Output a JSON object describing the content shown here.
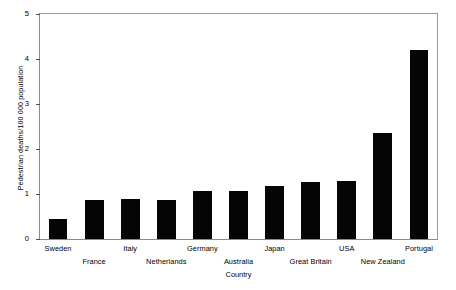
{
  "chart_data": {
    "type": "bar",
    "title": "",
    "xlabel": "Country",
    "ylabel": "Pedestrian deaths/100 000 population",
    "categories": [
      "Sweden",
      "France",
      "Italy",
      "Netherlands",
      "Germany",
      "Australia",
      "Japan",
      "Great Britain",
      "USA",
      "New Zealand",
      "Portugal"
    ],
    "values": [
      0.44,
      0.87,
      0.89,
      0.87,
      1.07,
      1.06,
      1.18,
      1.27,
      1.29,
      2.36,
      4.19
    ],
    "ylim": [
      0,
      5
    ],
    "yticks": [
      0,
      1,
      2,
      3,
      4,
      5
    ],
    "ytick_labels": [
      "0",
      "1",
      "2",
      "3",
      "4",
      "5"
    ],
    "grid": false,
    "legend": false,
    "bar_color": "#050505",
    "axis_color": "#8a8a8a",
    "label_stagger": [
      0,
      1,
      0,
      1,
      0,
      1,
      0,
      1,
      0,
      1,
      0
    ]
  }
}
